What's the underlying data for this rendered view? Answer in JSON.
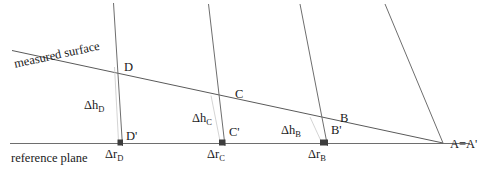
{
  "diagram": {
    "type": "line-diagram",
    "width": 491,
    "height": 177,
    "stroke_color": "#6e6e6e",
    "text_color": "#1a1a1a",
    "background": "#ffffff"
  },
  "labels": {
    "measured_surface": "measured surface",
    "reference_plane": "reference plane",
    "apex": "A=A'",
    "point_D": "D",
    "point_C": "C",
    "point_B": "B",
    "point_D_prime": "D'",
    "point_C_prime": "C'",
    "point_B_prime": "B'",
    "delta_h_D": "Δh",
    "delta_h_D_sub": "D",
    "delta_h_C": "Δh",
    "delta_h_C_sub": "C",
    "delta_h_B": "Δh",
    "delta_h_B_sub": "B",
    "delta_r_D": "Δr",
    "delta_r_D_sub": "D",
    "delta_r_C": "Δr",
    "delta_r_C_sub": "C",
    "delta_r_B": "Δr",
    "delta_r_B_sub": "B"
  },
  "geometry": {
    "reference_plane_line": {
      "x1": 10,
      "y1": 143.5,
      "x2": 470,
      "y2": 143.5
    },
    "measured_surface_line": {
      "x1": 12,
      "y1": 50.5,
      "x2": 443,
      "y2": 143
    },
    "apex_point": {
      "x": 443,
      "y": 143
    },
    "rays": [
      {
        "name": "ray-D",
        "x1": 113.5,
        "y1": 3,
        "x2": 122.5,
        "y2": 146
      },
      {
        "name": "ray-C",
        "x1": 208.5,
        "y1": 4,
        "x2": 225,
        "y2": 146
      },
      {
        "name": "ray-B",
        "x1": 300,
        "y1": 4,
        "x2": 327.5,
        "y2": 146
      },
      {
        "name": "ray-A",
        "x1": 385,
        "y1": 4,
        "x2": 443,
        "y2": 143
      }
    ],
    "tick_marks": [
      {
        "name": "tick-D-prime",
        "x": 117.5,
        "y": 139.5,
        "w": 5.5,
        "h": 6
      },
      {
        "name": "tick-C-prime",
        "x": 219,
        "y": 139.5,
        "w": 6.5,
        "h": 6
      },
      {
        "name": "tick-B-prime",
        "x": 320,
        "y": 139.5,
        "w": 8,
        "h": 6
      }
    ],
    "height_guides": [
      {
        "name": "guide-D",
        "x1": 114.5,
        "y1": 67,
        "x2": 118.5,
        "y2": 141
      },
      {
        "name": "guide-C",
        "x1": 211,
        "y1": 95.5,
        "x2": 220,
        "y2": 141
      },
      {
        "name": "guide-B",
        "x1": 310,
        "y1": 117,
        "x2": 321,
        "y2": 141
      }
    ]
  },
  "positions": {
    "measured_surface_text": {
      "x": 13,
      "y": 58,
      "rotate": -12.1
    },
    "reference_plane_text": {
      "x": 11,
      "y": 152
    },
    "apex_text": {
      "x": 450,
      "y": 138
    },
    "point_D": {
      "x": 124,
      "y": 61
    },
    "point_C": {
      "x": 235,
      "y": 88
    },
    "point_B": {
      "x": 340,
      "y": 112
    },
    "point_D_prime": {
      "x": 126,
      "y": 130
    },
    "point_C_prime": {
      "x": 229,
      "y": 126
    },
    "point_B_prime": {
      "x": 331,
      "y": 124
    },
    "delta_h_D": {
      "x": 84,
      "y": 99
    },
    "delta_h_C": {
      "x": 192,
      "y": 112
    },
    "delta_h_B": {
      "x": 281,
      "y": 124
    },
    "delta_r_D": {
      "x": 105,
      "y": 148
    },
    "delta_r_C": {
      "x": 207,
      "y": 148
    },
    "delta_r_B": {
      "x": 308,
      "y": 148
    }
  }
}
